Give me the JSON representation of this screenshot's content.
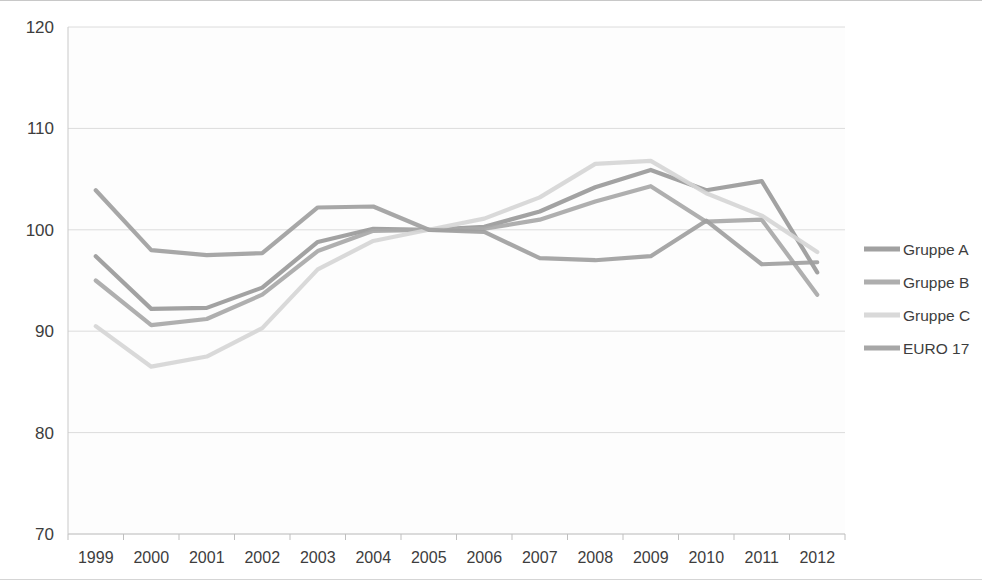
{
  "chart_data": {
    "type": "line",
    "title": "",
    "subtitle": "",
    "xlabel": "",
    "ylabel": "",
    "categories": [
      "1999",
      "2000",
      "2001",
      "2002",
      "2003",
      "2004",
      "2005",
      "2006",
      "2007",
      "2008",
      "2009",
      "2010",
      "2011",
      "2012"
    ],
    "x": [
      1999,
      2000,
      2001,
      2002,
      2003,
      2004,
      2005,
      2006,
      2007,
      2008,
      2009,
      2010,
      2011,
      2012
    ],
    "ylim": [
      70,
      120
    ],
    "yticks": [
      70,
      80,
      90,
      100,
      110,
      120
    ],
    "xlim": [
      1999,
      2012
    ],
    "grid": "horizontal",
    "legend_position": "right",
    "series": [
      {
        "name": "Gruppe A",
        "color": "#9a9a9a",
        "values": [
          97.4,
          92.2,
          92.3,
          94.3,
          98.8,
          100.1,
          100.0,
          100.3,
          101.8,
          104.2,
          105.9,
          103.9,
          104.8,
          95.8
        ]
      },
      {
        "name": "Gruppe B",
        "color": "#a8a8a8",
        "values": [
          95.0,
          90.6,
          91.2,
          93.6,
          97.9,
          99.9,
          100.0,
          100.1,
          101.0,
          102.8,
          104.3,
          100.8,
          101.0,
          93.6
        ]
      },
      {
        "name": "Gruppe C",
        "color": "#d6d6d6",
        "values": [
          90.5,
          86.5,
          87.5,
          90.3,
          96.1,
          98.9,
          100.0,
          101.1,
          103.2,
          106.5,
          106.8,
          103.6,
          101.4,
          97.8
        ]
      },
      {
        "name": "EURO 17",
        "color": "#a0a0a0",
        "values": [
          103.9,
          98.0,
          97.5,
          97.7,
          102.2,
          102.3,
          100.0,
          99.8,
          97.2,
          97.0,
          97.4,
          100.9,
          96.6,
          96.8
        ]
      }
    ]
  },
  "legend": {
    "items": [
      {
        "label": "Gruppe A"
      },
      {
        "label": "Gruppe B"
      },
      {
        "label": "Gruppe C"
      },
      {
        "label": "EURO 17"
      }
    ]
  },
  "axes": {
    "y_tick_labels": [
      "120",
      "110",
      "100",
      "90",
      "80",
      "70"
    ],
    "x_tick_labels": [
      "1999",
      "2000",
      "2001",
      "2002",
      "2003",
      "2004",
      "2005",
      "2006",
      "2007",
      "2008",
      "2009",
      "2010",
      "2011",
      "2012"
    ]
  }
}
